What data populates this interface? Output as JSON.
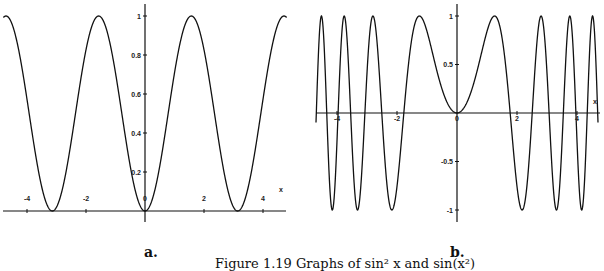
{
  "figure": {
    "caption": "Figure 1.19  Graphs of sin² x and sin(x²)",
    "panels": [
      {
        "label": "a."
      },
      {
        "label": "b."
      }
    ]
  },
  "chart_data": [
    {
      "type": "line",
      "panel": "a",
      "function": "sin^2(x)",
      "title": "",
      "xlabel": "x",
      "ylabel": "",
      "xlim": [
        -4.8,
        4.8
      ],
      "ylim": [
        0,
        1
      ],
      "x_ticks": [
        "-4",
        "-2",
        "0",
        "2",
        "4"
      ],
      "y_ticks": [
        "0",
        "0.2",
        "0.4",
        "0.6",
        "0.8",
        "1"
      ],
      "grid": false,
      "series": [
        {
          "name": "sin^2 x",
          "color": "#111111"
        }
      ]
    },
    {
      "type": "line",
      "panel": "b",
      "function": "sin(x^2)",
      "title": "",
      "xlabel": "x",
      "ylabel": "",
      "xlim": [
        -4.7,
        4.7
      ],
      "ylim": [
        -1,
        1
      ],
      "x_ticks": [
        "-4",
        "-2",
        "0",
        "2",
        "4"
      ],
      "y_ticks": [
        "-1",
        "-0.5",
        "0",
        "0.5",
        "1"
      ],
      "grid": false,
      "series": [
        {
          "name": "sin(x^2)",
          "color": "#111111"
        }
      ]
    }
  ]
}
